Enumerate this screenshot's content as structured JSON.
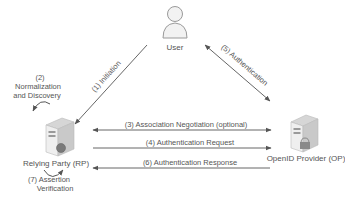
{
  "diagram": {
    "type": "OpenID authentication flow",
    "actors": {
      "user": {
        "label": "User",
        "icon": "user-icon"
      },
      "rp": {
        "label": "Relying Party (RP)",
        "icon": "server-globe-icon"
      },
      "op": {
        "label": "OpenID Provider (OP)",
        "icon": "server-lock-icon"
      }
    },
    "steps": {
      "s1": "(1) Initiation",
      "s2_line1": "(2)",
      "s2_line2": "Normalization",
      "s2_line3": "and Discovery",
      "s3": "(3) Association Negotiation (optional)",
      "s4": "(4) Authentication Request",
      "s5": "(5) Authentication",
      "s6": "(6) Authentication Response",
      "s7_line1": "(7) Assertion",
      "s7_line2": "Verification"
    },
    "colors": {
      "line": "#666666",
      "text": "#555555",
      "server_body": "#e6e6e6",
      "server_edge": "#bdbdbd"
    }
  }
}
